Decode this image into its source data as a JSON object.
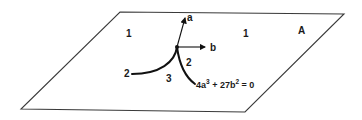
{
  "diagram": {
    "plane_label": "A",
    "region_labels": {
      "upper_left": "1",
      "upper_right": "1",
      "lower_middle": "3",
      "left_branch": "2",
      "right_branch": "2"
    },
    "axes": {
      "vertical": "a",
      "horizontal": "b"
    },
    "equation": {
      "part1": "4a",
      "exp1": "3",
      "part2": " + 27b",
      "exp2": "2",
      "part3": " = 0"
    },
    "colors": {
      "line": "#111111",
      "plane_edge": "#3a3a3a",
      "background": "#ffffff"
    }
  }
}
